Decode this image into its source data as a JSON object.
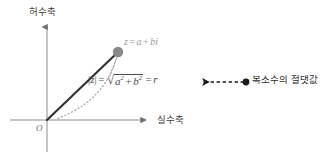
{
  "diagram": {
    "type": "complex-plane-argand",
    "background_color": "#ffffff",
    "axes": {
      "imaginary_label": "허수축",
      "real_label": "실수축",
      "origin_label": "O",
      "axis_color": "#8c8c8c",
      "vertical_axis_x": 47,
      "horizontal_axis_y": 120,
      "vertical_axis_top": 23,
      "vertical_axis_bottom": 152,
      "horizontal_axis_left": 10,
      "horizontal_axis_right": 150
    },
    "point": {
      "label_z": "z",
      "label_equals": "=",
      "label_a": "a",
      "label_plus": "+",
      "label_b": "b",
      "label_i": "i",
      "full_label": "z = a + bi",
      "marker_color": "#8a8a8a",
      "marker_x": 118,
      "marker_y": 52,
      "marker_radius": 5.2
    },
    "vector": {
      "from_x": 47,
      "from_y": 120,
      "to_x": 118,
      "to_y": 52,
      "color": "#2f2f2f",
      "width": 2
    },
    "arc": {
      "color": "#9a9a9a",
      "description": "dotted arc of radius r from point down to real axis"
    },
    "formula": {
      "abs_open": "|",
      "abs_z": "z",
      "abs_close": "|",
      "equals_1": "=",
      "radical_sign": "√",
      "term_a": "a",
      "exp_a": "2",
      "plus": "+",
      "term_b": "b",
      "exp_b": "2",
      "equals_2": "=",
      "result_r": "r",
      "plain_text": "|z| = √(a² + b²) = r"
    },
    "annotation": {
      "text": "복소수의 절댓값",
      "arrow_style": "dashed-left-arrow",
      "arrow_color": "#1a1a1a",
      "dot_color": "#1a1a1a",
      "dot_x": 246,
      "dot_y": 82,
      "arrow_tip_x": 200,
      "arrow_tip_y": 82
    }
  }
}
